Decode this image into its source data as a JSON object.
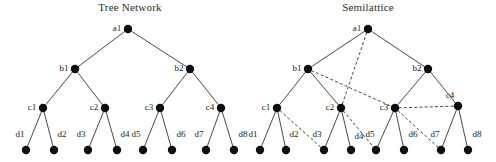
{
  "figure": {
    "width": 496,
    "height": 162,
    "background": "#ffffff",
    "ink_color": "#0d0d0d",
    "title_color": "#2b2b2b"
  },
  "panels": [
    {
      "id": "tree-network",
      "title": "Tree Network",
      "title_x": 130,
      "title_y": 11,
      "nodes": [
        {
          "id": "a1",
          "label": "a1",
          "x": 128,
          "y": 29,
          "r": 4.2,
          "label_dx": -11,
          "label_dy": 2
        },
        {
          "id": "b1",
          "label": "b1",
          "x": 75,
          "y": 69,
          "r": 4.2,
          "label_dx": -11,
          "label_dy": 2
        },
        {
          "id": "b2",
          "label": "b2",
          "x": 190,
          "y": 69,
          "r": 4.2,
          "label_dx": -11,
          "label_dy": 2
        },
        {
          "id": "c1",
          "label": "c1",
          "x": 43,
          "y": 108,
          "r": 4.2,
          "label_dx": -11,
          "label_dy": 2
        },
        {
          "id": "c2",
          "label": "c2",
          "x": 105,
          "y": 108,
          "r": 4.2,
          "label_dx": -11,
          "label_dy": 2
        },
        {
          "id": "c3",
          "label": "c3",
          "x": 160,
          "y": 108,
          "r": 4.2,
          "label_dx": -11,
          "label_dy": 2
        },
        {
          "id": "c4",
          "label": "c4",
          "x": 221,
          "y": 108,
          "r": 4.2,
          "label_dx": -11,
          "label_dy": 2
        },
        {
          "id": "d1",
          "label": "d1",
          "x": 26,
          "y": 150,
          "r": 4.2,
          "label_dx": -6,
          "label_dy": -13
        },
        {
          "id": "d2",
          "label": "d2",
          "x": 54,
          "y": 150,
          "r": 4.2,
          "label_dx": 8,
          "label_dy": -13
        },
        {
          "id": "d3",
          "label": "d3",
          "x": 88,
          "y": 150,
          "r": 4.2,
          "label_dx": -7,
          "label_dy": -13
        },
        {
          "id": "d4",
          "label": "d4",
          "x": 117,
          "y": 150,
          "r": 4.2,
          "label_dx": 8,
          "label_dy": -13
        },
        {
          "id": "d5",
          "label": "d5",
          "x": 143,
          "y": 150,
          "r": 4.2,
          "label_dx": -7,
          "label_dy": -13
        },
        {
          "id": "d6",
          "label": "d6",
          "x": 172,
          "y": 150,
          "r": 4.2,
          "label_dx": 9,
          "label_dy": -13
        },
        {
          "id": "d7",
          "label": "d7",
          "x": 206,
          "y": 150,
          "r": 4.2,
          "label_dx": -7,
          "label_dy": -13
        },
        {
          "id": "d8",
          "label": "d8",
          "x": 234,
          "y": 150,
          "r": 4.2,
          "label_dx": 9,
          "label_dy": -13
        }
      ],
      "edges_solid": [
        [
          "a1",
          "b1"
        ],
        [
          "a1",
          "b2"
        ],
        [
          "b1",
          "c1"
        ],
        [
          "b1",
          "c2"
        ],
        [
          "b2",
          "c3"
        ],
        [
          "b2",
          "c4"
        ],
        [
          "c1",
          "d1"
        ],
        [
          "c1",
          "d2"
        ],
        [
          "c2",
          "d3"
        ],
        [
          "c2",
          "d4"
        ],
        [
          "c3",
          "d5"
        ],
        [
          "c3",
          "d6"
        ],
        [
          "c4",
          "d7"
        ],
        [
          "c4",
          "d8"
        ]
      ],
      "edges_dashed": []
    },
    {
      "id": "semilattice",
      "title": "Semilattice",
      "title_x": 368,
      "title_y": 11,
      "nodes": [
        {
          "id": "a1",
          "label": "a1",
          "x": 368,
          "y": 29,
          "r": 4.2,
          "label_dx": -11,
          "label_dy": 2
        },
        {
          "id": "b1",
          "label": "b1",
          "x": 308,
          "y": 69,
          "r": 4.2,
          "label_dx": -11,
          "label_dy": 2
        },
        {
          "id": "b2",
          "label": "b2",
          "x": 428,
          "y": 69,
          "r": 4.2,
          "label_dx": -11,
          "label_dy": 2
        },
        {
          "id": "c1",
          "label": "c1",
          "x": 277,
          "y": 108,
          "r": 4.2,
          "label_dx": -11,
          "label_dy": 2
        },
        {
          "id": "c2",
          "label": "c2",
          "x": 341,
          "y": 108,
          "r": 4.2,
          "label_dx": -11,
          "label_dy": 2
        },
        {
          "id": "c3",
          "label": "c3",
          "x": 395,
          "y": 108,
          "r": 4.2,
          "label_dx": -11,
          "label_dy": 2
        },
        {
          "id": "c4",
          "label": "c4",
          "x": 458,
          "y": 106,
          "r": 4.2,
          "label_dx": -8,
          "label_dy": -8
        },
        {
          "id": "d1",
          "label": "d1",
          "x": 260,
          "y": 150,
          "r": 4.2,
          "label_dx": -7,
          "label_dy": -13
        },
        {
          "id": "d2",
          "label": "d2",
          "x": 286,
          "y": 150,
          "r": 4.2,
          "label_dx": 8,
          "label_dy": -13
        },
        {
          "id": "d3",
          "label": "d3",
          "x": 324,
          "y": 150,
          "r": 4.2,
          "label_dx": -7,
          "label_dy": -13
        },
        {
          "id": "d4",
          "label": "d4",
          "x": 351,
          "y": 150,
          "r": 4.2,
          "label_dx": 8,
          "label_dy": -11
        },
        {
          "id": "d5",
          "label": "d5",
          "x": 376,
          "y": 150,
          "r": 4.2,
          "label_dx": -6,
          "label_dy": -13
        },
        {
          "id": "d6",
          "label": "d6",
          "x": 404,
          "y": 150,
          "r": 4.2,
          "label_dx": 9,
          "label_dy": -13
        },
        {
          "id": "d7",
          "label": "d7",
          "x": 441,
          "y": 150,
          "r": 4.2,
          "label_dx": -6,
          "label_dy": -13
        },
        {
          "id": "d8",
          "label": "d8",
          "x": 468,
          "y": 150,
          "r": 4.2,
          "label_dx": 9,
          "label_dy": -13
        }
      ],
      "edges_solid": [
        [
          "a1",
          "b1"
        ],
        [
          "a1",
          "b2"
        ],
        [
          "b1",
          "c1"
        ],
        [
          "b1",
          "c2"
        ],
        [
          "b2",
          "c3"
        ],
        [
          "b2",
          "c4"
        ],
        [
          "c1",
          "d1"
        ],
        [
          "c1",
          "d2"
        ],
        [
          "c2",
          "d3"
        ],
        [
          "c2",
          "d4"
        ],
        [
          "c3",
          "d5"
        ],
        [
          "c3",
          "d6"
        ],
        [
          "c4",
          "d7"
        ],
        [
          "c4",
          "d8"
        ]
      ],
      "edges_dashed": [
        [
          "a1",
          "c2"
        ],
        [
          "b1",
          "c3"
        ],
        [
          "c1",
          "d3"
        ],
        [
          "c2",
          "d5"
        ],
        [
          "c3",
          "c4"
        ],
        [
          "c3",
          "d7"
        ]
      ]
    }
  ]
}
